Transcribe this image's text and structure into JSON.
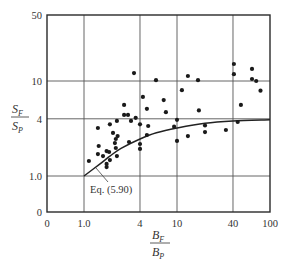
{
  "chart_data": {
    "type": "scatter",
    "title": "",
    "xlabel": "B_F / B_P",
    "ylabel": "S_F / S_P",
    "xscale": "log",
    "yscale": "log",
    "xlim": [
      0.6,
      100
    ],
    "ylim": [
      0.6,
      50
    ],
    "grid": true,
    "x_ticks": [
      {
        "label": "0",
        "value": null
      },
      {
        "label": "1.0",
        "value": 1.0
      },
      {
        "label": "4",
        "value": 4
      },
      {
        "label": "10",
        "value": 10
      },
      {
        "label": "40",
        "value": 40
      },
      {
        "label": "100",
        "value": 100
      }
    ],
    "y_ticks": [
      {
        "label": "0",
        "value": null
      },
      {
        "label": "1.0",
        "value": 1.0
      },
      {
        "label": "4",
        "value": 4
      },
      {
        "label": "10",
        "value": 10
      },
      {
        "label": "50",
        "value": 50
      }
    ],
    "series": [
      {
        "name": "Observed data",
        "kind": "scatter",
        "points": [
          [
            1.13,
            1.44
          ],
          [
            1.41,
            3.2
          ],
          [
            1.44,
            2.07
          ],
          [
            1.41,
            1.7
          ],
          [
            1.6,
            1.62
          ],
          [
            1.75,
            1.83
          ],
          [
            1.75,
            1.34
          ],
          [
            1.75,
            1.24
          ],
          [
            1.86,
            1.79
          ],
          [
            1.9,
            1.47
          ],
          [
            1.9,
            3.5
          ],
          [
            2.05,
            2.84
          ],
          [
            2.15,
            2.22
          ],
          [
            2.2,
            1.97
          ],
          [
            2.2,
            2.45
          ],
          [
            2.26,
            1.62
          ],
          [
            2.26,
            3.8
          ],
          [
            2.3,
            2.63
          ],
          [
            2.7,
            5.6
          ],
          [
            2.7,
            4.4
          ],
          [
            2.97,
            4.4
          ],
          [
            3.05,
            2.28
          ],
          [
            3.2,
            3.8
          ],
          [
            3.45,
            12.1
          ],
          [
            3.6,
            4.1
          ],
          [
            4.0,
            3.5
          ],
          [
            4.0,
            2.17
          ],
          [
            4.0,
            1.93
          ],
          [
            4.3,
            6.8
          ],
          [
            4.75,
            5.1
          ],
          [
            4.9,
            3.36
          ],
          [
            4.75,
            2.7
          ],
          [
            5.95,
            10.2
          ],
          [
            7.2,
            6.3
          ],
          [
            7.6,
            4.7
          ],
          [
            9.3,
            3.3
          ],
          [
            10,
            3.9
          ],
          [
            10,
            2.34
          ],
          [
            11.3,
            8.0
          ],
          [
            13.1,
            11.3
          ],
          [
            13.1,
            2.63
          ],
          [
            16.8,
            10.2
          ],
          [
            17.2,
            4.9
          ],
          [
            20,
            3.4
          ],
          [
            20,
            2.9
          ],
          [
            33.6,
            3.05
          ],
          [
            40.9,
            15.1
          ],
          [
            40.9,
            11.8
          ],
          [
            45,
            3.7
          ],
          [
            48.6,
            5.6
          ],
          [
            64,
            13.4
          ],
          [
            64,
            10.5
          ],
          [
            71,
            10.0
          ],
          [
            79,
            7.9
          ]
        ]
      },
      {
        "name": "Eq. (5.90)",
        "kind": "line",
        "points": [
          [
            1.0,
            1.0
          ],
          [
            1.5,
            1.35
          ],
          [
            1.9,
            1.62
          ],
          [
            2.5,
            1.95
          ],
          [
            4,
            2.45
          ],
          [
            6,
            2.85
          ],
          [
            10,
            3.2
          ],
          [
            20,
            3.6
          ],
          [
            40,
            3.8
          ],
          [
            100,
            3.9
          ]
        ]
      }
    ],
    "annotations": [
      {
        "text": "Eq. (5.90)",
        "points_to": [
          1.45,
          1.38
        ]
      }
    ]
  },
  "labels": {
    "y_num": "S",
    "y_num_sub": "F",
    "y_den": "S",
    "y_den_sub": "P",
    "x_num": "B",
    "x_num_sub": "F",
    "x_den": "B",
    "x_den_sub": "P",
    "annotation": "Eq. (5.90)"
  },
  "colors": {
    "ink": "#2a2a2a",
    "grid": "#555555",
    "background": "#ffffff"
  }
}
